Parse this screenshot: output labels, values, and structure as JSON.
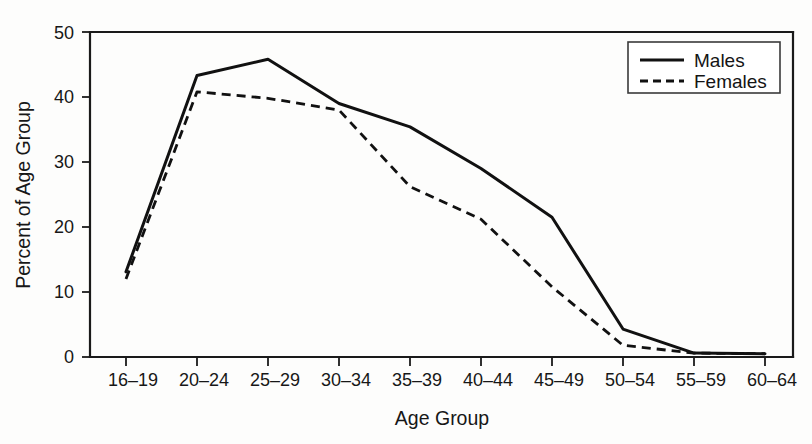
{
  "chart_data": {
    "type": "line",
    "title": "",
    "xlabel": "Age Group",
    "ylabel": "Percent of Age Group",
    "categories": [
      "16–19",
      "20–24",
      "25–29",
      "30–34",
      "35–39",
      "40–44",
      "45–49",
      "50–54",
      "55–59",
      "60–64"
    ],
    "ylim": [
      0,
      50
    ],
    "yticks": [
      0,
      10,
      20,
      30,
      40,
      50
    ],
    "ytick_labels": [
      "0",
      "10",
      "20",
      "30",
      "40",
      "50"
    ],
    "grid": false,
    "legend_position": "top-right",
    "series": [
      {
        "name": "Males",
        "style": "solid",
        "color": "#111111",
        "values": [
          13.1,
          43.3,
          45.8,
          39.0,
          35.4,
          29.0,
          21.5,
          4.3,
          0.6,
          0.5
        ]
      },
      {
        "name": "Females",
        "style": "dashed",
        "color": "#111111",
        "values": [
          12.0,
          40.8,
          39.8,
          38.0,
          26.2,
          21.2,
          10.8,
          1.8,
          0.6,
          0.5
        ]
      }
    ],
    "annotations": []
  },
  "legend": {
    "entries": [
      {
        "label": "Males",
        "style": "solid"
      },
      {
        "label": "Females",
        "style": "dashed"
      }
    ]
  },
  "axes": {
    "y_title": "Percent of Age Group",
    "x_title": "Age Group"
  }
}
